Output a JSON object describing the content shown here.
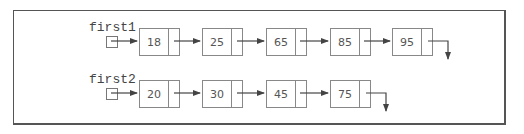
{
  "lists": [
    {
      "label": "first1",
      "values": [
        "18",
        "25",
        "65",
        "85",
        "95"
      ]
    },
    {
      "label": "first2",
      "values": [
        "20",
        "30",
        "45",
        "75"
      ]
    }
  ],
  "colors": {
    "line": "#555555",
    "box": "#888888",
    "text": "#444444"
  }
}
